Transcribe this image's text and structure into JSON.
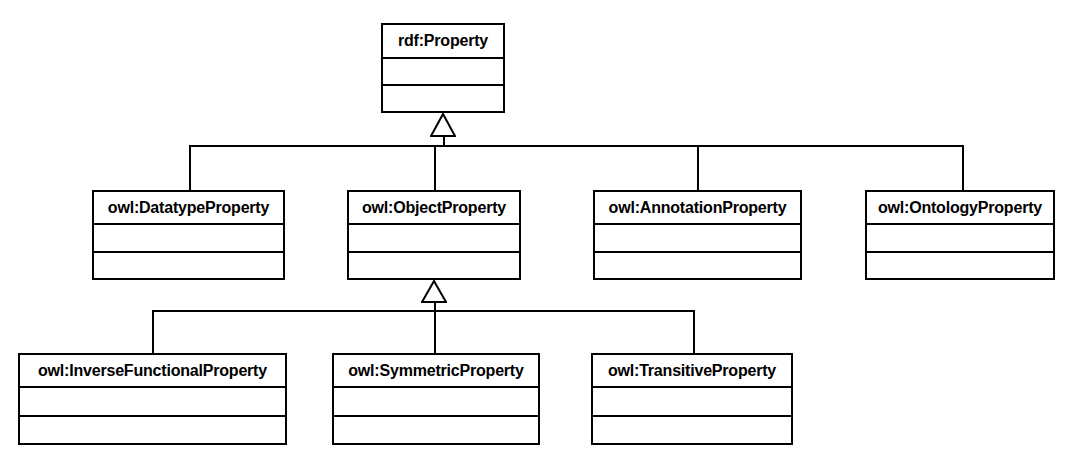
{
  "diagram": {
    "type": "uml-class-diagram",
    "background_color": "#ffffff",
    "line_color": "#000000",
    "text_color": "#000000"
  },
  "classes": [
    {
      "id": "rdf-property",
      "name": "rdf:Property",
      "x": 381,
      "y": 23,
      "width": 124,
      "height": 90,
      "name_h": 34,
      "attrs_h": 27
    },
    {
      "id": "owl-datatypeproperty",
      "name": "owl:DatatypeProperty",
      "x": 92,
      "y": 190,
      "width": 193,
      "height": 90,
      "name_h": 33,
      "attrs_h": 28
    },
    {
      "id": "owl-objectproperty",
      "name": "owl:ObjectProperty",
      "x": 347,
      "y": 190,
      "width": 174,
      "height": 90,
      "name_h": 33,
      "attrs_h": 28
    },
    {
      "id": "owl-annotationproperty",
      "name": "owl:AnnotationProperty",
      "x": 593,
      "y": 190,
      "width": 209,
      "height": 90,
      "name_h": 33,
      "attrs_h": 28
    },
    {
      "id": "owl-ontologyproperty",
      "name": "owl:OntologyProperty",
      "x": 865,
      "y": 190,
      "width": 190,
      "height": 90,
      "name_h": 33,
      "attrs_h": 28
    },
    {
      "id": "owl-inversefunctionalproperty",
      "name": "owl:InverseFunctionalProperty",
      "x": 18,
      "y": 353,
      "width": 269,
      "height": 92,
      "name_h": 33,
      "attrs_h": 29
    },
    {
      "id": "owl-symmetricproperty",
      "name": "owl:SymmetricProperty",
      "x": 332,
      "y": 353,
      "width": 208,
      "height": 92,
      "name_h": 33,
      "attrs_h": 29
    },
    {
      "id": "owl-transitiveproperty",
      "name": "owl:TransitiveProperty",
      "x": 591,
      "y": 353,
      "width": 202,
      "height": 92,
      "name_h": 33,
      "attrs_h": 29
    }
  ],
  "generalizations": [
    {
      "id": "gen-rdf-property",
      "parent": "rdf:Property",
      "children": [
        "owl:DatatypeProperty",
        "owl:ObjectProperty",
        "owl:AnnotationProperty",
        "owl:OntologyProperty"
      ],
      "arrow_x": 443,
      "arrow_top": 113,
      "arrow_height": 24,
      "arrow_width": 26,
      "bus_y": 145,
      "bus_left": 189,
      "bus_right": 962,
      "drops": [
        189,
        434,
        697,
        962
      ]
    },
    {
      "id": "gen-owl-objectproperty",
      "parent": "owl:ObjectProperty",
      "children": [
        "owl:InverseFunctionalProperty",
        "owl:SymmetricProperty",
        "owl:TransitiveProperty"
      ],
      "arrow_x": 434,
      "arrow_top": 280,
      "arrow_height": 23,
      "arrow_width": 26,
      "bus_y": 310,
      "bus_left": 152,
      "bus_right": 693,
      "drops": [
        152,
        434,
        693
      ]
    }
  ]
}
